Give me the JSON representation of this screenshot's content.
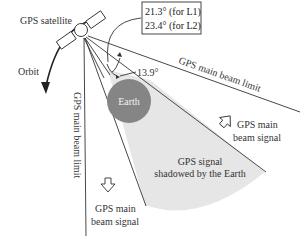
{
  "labels": {
    "satellite": "GPS satellite",
    "orbit": "Orbit",
    "angle_l1": "21.3° (for L1)",
    "angle_l2": "23.4° (for L2)",
    "earth_angle": "13.9°",
    "earth": "Earth",
    "beam_limit_right": "GPS main beam limit",
    "beam_limit_left": "GPS main beam limit",
    "signal_right_line1": "GPS main",
    "signal_right_line2": "beam signal",
    "signal_left_line1": "GPS main",
    "signal_left_line2": "beam signal",
    "shadow_line1": "GPS signal",
    "shadow_line2": "shadowed by the Earth"
  },
  "colors": {
    "line": "#333333",
    "earth_fill": "#858585",
    "shadow_fill": "#e6e6e6",
    "background": "#ffffff"
  },
  "icons": {
    "satellite": "satellite-icon",
    "orbit_arrow": "orbit-arrow-icon",
    "signal_arrow_right": "hollow-arrow-icon",
    "signal_arrow_left": "hollow-arrow-icon"
  }
}
